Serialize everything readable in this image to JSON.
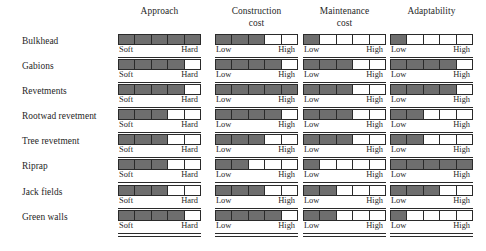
{
  "figure": {
    "type": "matrix-rating-chart",
    "row_label_header": "",
    "columns": [
      {
        "id": "approach",
        "line1": "Approach",
        "line2": "",
        "low": "Soft",
        "high": "Hard",
        "x": 118
      },
      {
        "id": "construction_cost",
        "line1": "Construction",
        "line2": "cost",
        "low": "Low",
        "high": "High",
        "x": 215
      },
      {
        "id": "maintenance_cost",
        "line1": "Maintenance",
        "line2": "cost",
        "low": "Low",
        "high": "High",
        "x": 303
      },
      {
        "id": "adaptability",
        "line1": "Adaptability",
        "line2": "",
        "low": "Low",
        "high": "High",
        "x": 390
      }
    ],
    "rows": [
      {
        "label": "Bulkhead"
      },
      {
        "label": "Gabions"
      },
      {
        "label": "Revetments"
      },
      {
        "label": "Rootwad revetment"
      },
      {
        "label": "Tree revetment"
      },
      {
        "label": "Riprap"
      },
      {
        "label": "Jack fields"
      },
      {
        "label": "Green walls"
      }
    ],
    "colors": {
      "filled": "#6e6e6e",
      "empty": "#ffffff",
      "border": "#2a2a2a",
      "text": "#1f1f1f",
      "background": "#ffffff"
    }
  },
  "chart_data": {
    "type": "heatmap",
    "title": "",
    "xlabel": "",
    "ylabel": "",
    "scale_max": 5,
    "scale_min": 0,
    "grid": false,
    "legend": "none",
    "categories": [
      "Bulkhead",
      "Gabions",
      "Revetments",
      "Rootwad revetment",
      "Tree revetment",
      "Riprap",
      "Jack fields",
      "Green walls"
    ],
    "series": [
      {
        "name": "Approach",
        "low_label": "Soft",
        "high_label": "Hard",
        "values": [
          5,
          4,
          4,
          3,
          3,
          3,
          3,
          4
        ]
      },
      {
        "name": "Construction cost",
        "low_label": "Low",
        "high_label": "High",
        "values": [
          3,
          4,
          5,
          4,
          3,
          2,
          3,
          4
        ]
      },
      {
        "name": "Maintenance cost",
        "low_label": "Low",
        "high_label": "High",
        "values": [
          1,
          3,
          3,
          3,
          3,
          1,
          2,
          2
        ]
      },
      {
        "name": "Adaptability",
        "low_label": "Low",
        "high_label": "High",
        "values": [
          1,
          4,
          4,
          2,
          2,
          5,
          3,
          1
        ]
      }
    ]
  }
}
